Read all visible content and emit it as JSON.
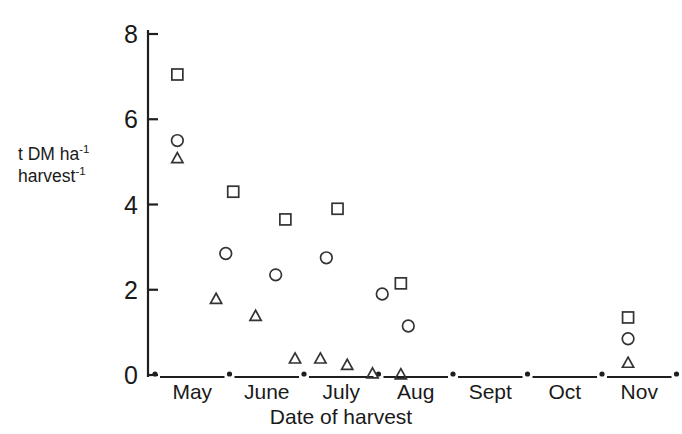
{
  "chart_data": {
    "type": "scatter",
    "title": "",
    "xlabel": "Date of harvest",
    "ylabel_line1": "t DM ha",
    "ylabel_line1_sup": "-1",
    "ylabel_line2": "harvest",
    "ylabel_line2_sup": "-1",
    "ylim": [
      0,
      8
    ],
    "yticks": [
      0,
      2,
      4,
      6,
      8
    ],
    "ytick_labels": [
      "0",
      "2",
      "4",
      "6",
      "8"
    ],
    "xtick_labels": [
      "May",
      "June",
      "July",
      "Aug",
      "Sept",
      "Oct",
      "Nov"
    ],
    "grid": false,
    "legend": "none",
    "series": [
      {
        "name": "square",
        "marker": "square",
        "x": [
          0.3,
          1.05,
          1.75,
          2.45,
          3.3,
          6.35
        ],
        "y": [
          7.05,
          4.3,
          3.65,
          3.9,
          2.15,
          1.35
        ]
      },
      {
        "name": "circle",
        "marker": "circle",
        "x": [
          0.3,
          0.95,
          1.62,
          2.3,
          3.05,
          3.4,
          6.35
        ],
        "y": [
          5.5,
          2.85,
          2.35,
          2.75,
          1.9,
          1.15,
          0.85
        ]
      },
      {
        "name": "triangle",
        "marker": "triangle",
        "x": [
          0.3,
          0.82,
          1.35,
          1.88,
          2.22,
          2.58,
          2.92,
          3.3,
          6.35
        ],
        "y": [
          5.1,
          1.8,
          1.4,
          0.4,
          0.4,
          0.25,
          0.05,
          0.03,
          0.3
        ]
      }
    ]
  }
}
